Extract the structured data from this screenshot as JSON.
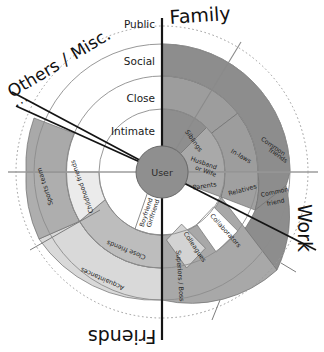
{
  "diagram": {
    "title_center": "User",
    "rings": [
      {
        "name": "intimate",
        "label": "Intimate"
      },
      {
        "name": "close",
        "label": "Close"
      },
      {
        "name": "social",
        "label": "Social"
      },
      {
        "name": "public",
        "label": "Public"
      }
    ],
    "sectors": [
      {
        "name": "family",
        "label": "Family"
      },
      {
        "name": "work",
        "label": "Work"
      },
      {
        "name": "friends",
        "label": "Friends"
      },
      {
        "name": "others",
        "label": "Others / Misc."
      }
    ],
    "ellipsis": "...",
    "segments": {
      "family": [
        {
          "name": "siblings",
          "label": "Siblings"
        },
        {
          "name": "husband-or-wife",
          "label": "Husband or Wife"
        },
        {
          "name": "parents",
          "label": "Parents"
        },
        {
          "name": "in-laws",
          "label": "In-laws"
        },
        {
          "name": "relatives",
          "label": "Relatives"
        },
        {
          "name": "common-friends-upper",
          "label": "Common friends"
        },
        {
          "name": "common-friend-lower",
          "label": "Common friend"
        }
      ],
      "work": [
        {
          "name": "collaborators",
          "label": "Collaborators"
        },
        {
          "name": "colleagues",
          "label": "Colleagues"
        },
        {
          "name": "superiors-boss",
          "label": "Superiors / Boss"
        }
      ],
      "friends": [
        {
          "name": "boyfriend-girlfriend",
          "label": "Boyfriend Girlfriend"
        },
        {
          "name": "close-friends",
          "label": "Close friends"
        },
        {
          "name": "acquaintances",
          "label": "Acquaintances"
        },
        {
          "name": "childhood-friends",
          "label": "Childhood friends"
        },
        {
          "name": "sports-team",
          "label": "Sports team"
        }
      ]
    },
    "colors": {
      "center_fill": "#8f8f8f",
      "family_dark": "#8e8e8e",
      "family_mid": "#a3a3a3",
      "family_light": "#b9b9b9",
      "work_mid": "#a8a8a8",
      "work_light": "#c9c9c9",
      "friends_mid": "#b4b4b4",
      "friends_light": "#d2d2d2",
      "friends_pale": "#e4e4e4",
      "white": "#ffffff",
      "stroke": "#6f6f6f",
      "axis": "#111111"
    }
  }
}
